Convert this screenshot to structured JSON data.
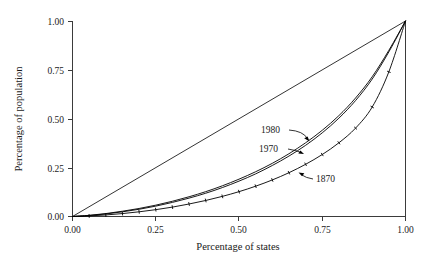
{
  "chart_data": {
    "type": "line",
    "title": "",
    "subtitle": "",
    "xlabel": "Percentage of states",
    "ylabel": "Percentage of population",
    "xlim": [
      0.0,
      1.0
    ],
    "ylim": [
      0.0,
      1.0
    ],
    "grid": false,
    "legend_position": "inline-annotations",
    "xticks": [
      "0.00",
      "0.25",
      "0.50",
      "0.75",
      "1.00"
    ],
    "yticks": [
      "0.00",
      "0.25",
      "0.50",
      "0.75",
      "1.00"
    ],
    "xtick_values": [
      0.0,
      0.25,
      0.5,
      0.75,
      1.0
    ],
    "ytick_values": [
      0.0,
      0.25,
      0.5,
      0.75,
      1.0
    ],
    "annotations": [
      {
        "text": "1980",
        "x": 0.635,
        "y": 0.445,
        "points_to_x": 0.775,
        "points_to_y": 0.385
      },
      {
        "text": "1970",
        "x": 0.625,
        "y": 0.355,
        "points_to_x": 0.735,
        "points_to_y": 0.315
      },
      {
        "text": "1870",
        "x": 0.79,
        "y": 0.205,
        "points_to_x": 0.705,
        "points_to_y": 0.225
      }
    ],
    "series": [
      {
        "name": "equality-line",
        "style": "straight-reference",
        "x": [
          0.0,
          1.0
        ],
        "values": [
          0.0,
          1.0
        ]
      },
      {
        "name": "1980",
        "style": "smooth-curve",
        "x": [
          0.0,
          0.05,
          0.1,
          0.15,
          0.2,
          0.25,
          0.3,
          0.35,
          0.4,
          0.45,
          0.5,
          0.55,
          0.6,
          0.65,
          0.7,
          0.75,
          0.8,
          0.85,
          0.9,
          0.95,
          1.0
        ],
        "values": [
          0.0,
          0.006,
          0.015,
          0.027,
          0.041,
          0.058,
          0.078,
          0.101,
          0.127,
          0.157,
          0.191,
          0.229,
          0.272,
          0.321,
          0.377,
          0.441,
          0.516,
          0.606,
          0.715,
          0.85,
          1.0
        ]
      },
      {
        "name": "1970",
        "style": "smooth-curve",
        "x": [
          0.0,
          0.05,
          0.1,
          0.15,
          0.2,
          0.25,
          0.3,
          0.35,
          0.4,
          0.45,
          0.5,
          0.55,
          0.6,
          0.65,
          0.7,
          0.75,
          0.8,
          0.85,
          0.9,
          0.95,
          1.0
        ],
        "values": [
          0.0,
          0.005,
          0.013,
          0.024,
          0.037,
          0.053,
          0.072,
          0.094,
          0.119,
          0.148,
          0.181,
          0.218,
          0.261,
          0.309,
          0.364,
          0.428,
          0.503,
          0.593,
          0.703,
          0.842,
          1.0
        ]
      },
      {
        "name": "1870",
        "style": "smooth-curve-with-point-markers",
        "x": [
          0.0,
          0.05,
          0.1,
          0.15,
          0.2,
          0.25,
          0.3,
          0.35,
          0.4,
          0.45,
          0.5,
          0.55,
          0.6,
          0.65,
          0.7,
          0.75,
          0.8,
          0.85,
          0.9,
          0.95,
          1.0
        ],
        "values": [
          0.0,
          0.003,
          0.008,
          0.015,
          0.024,
          0.035,
          0.048,
          0.064,
          0.082,
          0.103,
          0.127,
          0.155,
          0.187,
          0.224,
          0.267,
          0.317,
          0.377,
          0.452,
          0.56,
          0.74,
          1.0
        ]
      }
    ]
  },
  "axes": {
    "x_title": "Percentage of states",
    "y_title": "Percentage of population"
  },
  "labels": {
    "s1980": "1980",
    "s1970": "1970",
    "s1870": "1870"
  },
  "ticks": {
    "x0": "0.00",
    "x1": "0.25",
    "x2": "0.50",
    "x3": "0.75",
    "x4": "1.00",
    "y0": "0.00",
    "y1": "0.25",
    "y2": "0.50",
    "y3": "0.75",
    "y4": "1.00"
  },
  "colors": {
    "line": "#000000",
    "axis": "#3b3b3b",
    "background": "#ffffff",
    "text": "#1a1a1a"
  }
}
